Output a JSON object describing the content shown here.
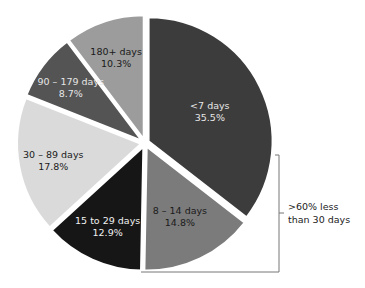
{
  "chart_data": {
    "type": "pie",
    "title": "",
    "categories": [
      "<7 days",
      "8 – 14 days",
      "15 to 29 days",
      "30 – 89 days",
      "90 – 179 days",
      "180+ days"
    ],
    "values": [
      35.5,
      14.8,
      12.9,
      17.8,
      8.7,
      10.3
    ],
    "value_labels": [
      "35.5%",
      "14.8%",
      "12.9%",
      "17.8%",
      "8.7%",
      "10.3%"
    ],
    "colors": [
      "#3c3c3c",
      "#7b7b7b",
      "#161616",
      "#dadada",
      "#545454",
      "#9c9c9c"
    ],
    "label_colors": [
      "#e6e6e6",
      "#1a1a1a",
      "#f0f0f0",
      "#1a1a1a",
      "#e6e6e6",
      "#1a1a1a"
    ],
    "start_angle": "12 o'clock, clockwise",
    "exploded": true,
    "legend": "none (labels inside slices)",
    "annotation": {
      "line1": ">60% less",
      "line2": "than 30 days",
      "brackets_slices": [
        "<7 days",
        "8 – 14 days",
        "15 to 29 days"
      ]
    }
  }
}
